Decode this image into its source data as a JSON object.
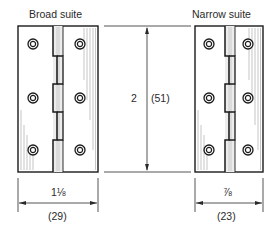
{
  "diagram": {
    "broad": {
      "title": "Broad suite",
      "width_fraction": "1⅛",
      "width_mm": "(29)"
    },
    "narrow": {
      "title": "Narrow suite",
      "width_fraction": "⅞",
      "width_mm": "(23)"
    },
    "height": {
      "inches": "2",
      "mm": "(51)"
    },
    "colors": {
      "line": "#1a1a1a",
      "hatch": "#9a9a9a",
      "knuckle_fill": "#e6e6e6"
    }
  }
}
